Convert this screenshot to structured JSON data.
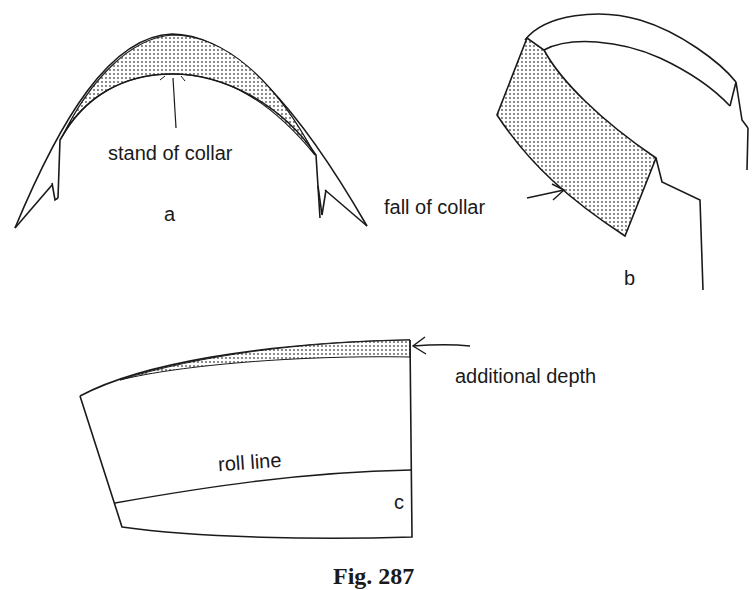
{
  "figure": {
    "caption": "Fig. 287",
    "panels": [
      {
        "id": "a",
        "label": "a",
        "annotation": "stand of collar"
      },
      {
        "id": "b",
        "label": "b",
        "annotation": "fall of collar"
      },
      {
        "id": "c",
        "label": "c",
        "annotations": [
          "additional depth",
          "roll line"
        ]
      }
    ],
    "colors": {
      "line": "#1a1a1a",
      "shading": "#8a8a8a",
      "background": "#ffffff"
    }
  }
}
